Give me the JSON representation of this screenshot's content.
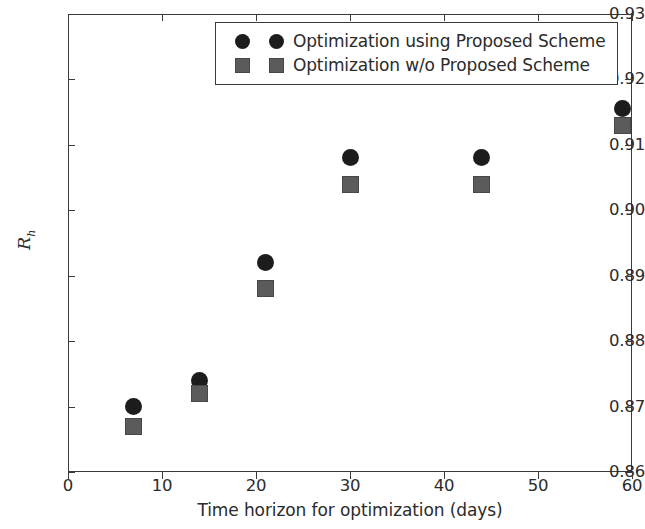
{
  "chart_data": {
    "type": "scatter",
    "title": "",
    "xlabel": "Time horizon for optimization (days)",
    "ylabel": "R_h",
    "ylabel_base": "R",
    "ylabel_sub": "h",
    "xlim": [
      0,
      60
    ],
    "ylim": [
      0.86,
      0.93
    ],
    "xticks": [
      0,
      10,
      20,
      30,
      40,
      50,
      60
    ],
    "xtick_labels": [
      "0",
      "10",
      "20",
      "30",
      "40",
      "50",
      "60"
    ],
    "yticks": [
      0.86,
      0.87,
      0.88,
      0.89,
      0.9,
      0.91,
      0.92,
      0.93
    ],
    "ytick_labels": [
      "0.86",
      "0.87",
      "0.88",
      "0.89",
      "0.90",
      "0.91",
      "0.92",
      "0.93"
    ],
    "grid": false,
    "legend_position": "upper center",
    "series": [
      {
        "name": "Optimization using Proposed Scheme",
        "marker": "circle",
        "color": "#1c1c1c",
        "x": [
          7,
          14,
          21,
          30,
          44,
          59
        ],
        "values": [
          0.87,
          0.874,
          0.892,
          0.908,
          0.908,
          0.9155
        ]
      },
      {
        "name": "Optimization w/o Proposed Scheme",
        "marker": "square",
        "color": "#5b5b5b",
        "x": [
          7,
          14,
          21,
          30,
          44,
          59
        ],
        "values": [
          0.867,
          0.872,
          0.888,
          0.904,
          0.904,
          0.913
        ]
      }
    ]
  },
  "legend": {
    "entries": [
      {
        "label": "Optimization using Proposed Scheme",
        "marker": "circle"
      },
      {
        "label": "Optimization w/o Proposed Scheme",
        "marker": "square"
      }
    ]
  },
  "colors": {
    "series_proposed": "#1c1c1c",
    "series_without": "#5b5b5b",
    "axis": "#3a3a3a",
    "text": "#2b2b2b",
    "background": "#ffffff"
  }
}
